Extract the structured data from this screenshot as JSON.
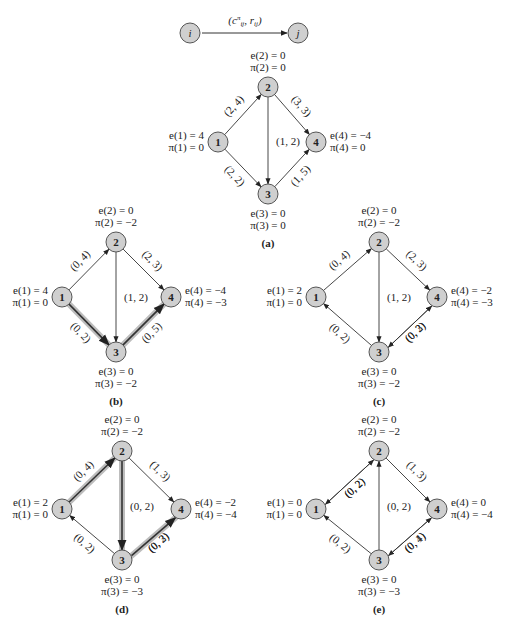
{
  "legend": {
    "node_i": "i",
    "node_j": "j",
    "edge_label": "(c^π_ij, r_ij)"
  },
  "colors": {
    "node_fill": "#cfcfcf",
    "node_stroke": "#555555",
    "edge": "#333333",
    "highlight": "#bdbdbd"
  },
  "panels": [
    {
      "id": "a",
      "caption": "(a)",
      "nodes": {
        "1": {
          "e": "e(1) = 4",
          "pi": "π(1) = 0"
        },
        "2": {
          "e": "e(2) = 0",
          "pi": "π(2) = 0"
        },
        "3": {
          "e": "e(3) = 0",
          "pi": "π(3) = 0"
        },
        "4": {
          "e": "e(4) = −4",
          "pi": "π(4) = 0"
        }
      },
      "edges": [
        {
          "from": "1",
          "to": "2",
          "label": "(2, 4)"
        },
        {
          "from": "1",
          "to": "3",
          "label": "(2, 2)"
        },
        {
          "from": "2",
          "to": "3",
          "label": "(1, 2)"
        },
        {
          "from": "2",
          "to": "4",
          "label": "(3, 3)"
        },
        {
          "from": "3",
          "to": "4",
          "label": "(1, 5)"
        }
      ]
    },
    {
      "id": "b",
      "caption": "(b)",
      "nodes": {
        "1": {
          "e": "e(1) = 4",
          "pi": "π(1) = 0"
        },
        "2": {
          "e": "e(2) = 0",
          "pi": "π(2) = −2"
        },
        "3": {
          "e": "e(3) = 0",
          "pi": "π(3) = −2"
        },
        "4": {
          "e": "e(4) = −4",
          "pi": "π(4) = −3"
        }
      },
      "edges": [
        {
          "from": "1",
          "to": "2",
          "label": "(0, 4)"
        },
        {
          "from": "1",
          "to": "3",
          "label": "(0, 2)",
          "highlight": true
        },
        {
          "from": "2",
          "to": "3",
          "label": "(1, 2)"
        },
        {
          "from": "2",
          "to": "4",
          "label": "(2, 3)"
        },
        {
          "from": "3",
          "to": "4",
          "label": "(0, 5)",
          "highlight": true
        }
      ]
    },
    {
      "id": "c",
      "caption": "(c)",
      "nodes": {
        "1": {
          "e": "e(1) = 2",
          "pi": "π(1) = 0"
        },
        "2": {
          "e": "e(2) = 0",
          "pi": "π(2) = −2"
        },
        "3": {
          "e": "e(3) = 0",
          "pi": "π(3) = −2"
        },
        "4": {
          "e": "e(4) = −2",
          "pi": "π(4) = −3"
        }
      },
      "edges": [
        {
          "from": "1",
          "to": "2",
          "label": "(0, 4)"
        },
        {
          "from": "3",
          "to": "1",
          "label": "(0, 2)"
        },
        {
          "from": "2",
          "to": "3",
          "label": "(1, 2)"
        },
        {
          "from": "2",
          "to": "4",
          "label": "(2, 3)"
        },
        {
          "from": "4",
          "to": "3",
          "label": "(0, 2)"
        },
        {
          "from": "3",
          "to": "4",
          "label": "(0, 3)"
        }
      ]
    },
    {
      "id": "d",
      "caption": "(d)",
      "nodes": {
        "1": {
          "e": "e(1) = 2",
          "pi": "π(1) = 0"
        },
        "2": {
          "e": "e(2) = 0",
          "pi": "π(2) = −2"
        },
        "3": {
          "e": "e(3) = 0",
          "pi": "π(3) = −3"
        },
        "4": {
          "e": "e(4) = −2",
          "pi": "π(4) = −4"
        }
      },
      "edges": [
        {
          "from": "1",
          "to": "2",
          "label": "(0, 4)",
          "highlight": true
        },
        {
          "from": "3",
          "to": "1",
          "label": "(0, 2)"
        },
        {
          "from": "2",
          "to": "3",
          "label": "(0, 2)",
          "highlight": true
        },
        {
          "from": "2",
          "to": "4",
          "label": "(1, 3)"
        },
        {
          "from": "4",
          "to": "3",
          "label": "(0, 2)"
        },
        {
          "from": "3",
          "to": "4",
          "label": "(0, 3)",
          "highlight": true
        }
      ]
    },
    {
      "id": "e",
      "caption": "(e)",
      "nodes": {
        "1": {
          "e": "e(1) = 0",
          "pi": "π(1) = 0"
        },
        "2": {
          "e": "e(2) = 0",
          "pi": "π(2) = −2"
        },
        "3": {
          "e": "e(3) = 0",
          "pi": "π(3) = −3"
        },
        "4": {
          "e": "e(4) = 0",
          "pi": "π(4) = −4"
        }
      },
      "edges": [
        {
          "from": "1",
          "to": "2",
          "label": "(0, 2)"
        },
        {
          "from": "2",
          "to": "1",
          "label": "(0, 2)"
        },
        {
          "from": "3",
          "to": "1",
          "label": "(0, 2)"
        },
        {
          "from": "3",
          "to": "2",
          "label": "(0, 2)"
        },
        {
          "from": "2",
          "to": "4",
          "label": "(1, 3)"
        },
        {
          "from": "4",
          "to": "3",
          "label": "(0, 4)"
        },
        {
          "from": "3",
          "to": "4",
          "label": "(0, 1)"
        }
      ]
    }
  ]
}
